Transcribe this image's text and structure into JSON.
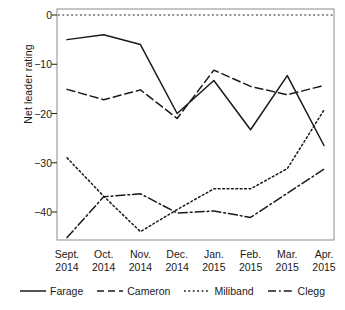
{
  "chart_data": {
    "type": "line",
    "title": "",
    "xlabel": "",
    "ylabel": "Net leader rating",
    "ylim": [
      -47,
      1
    ],
    "yticks": [
      0,
      -10,
      -20,
      -30,
      -40
    ],
    "ytick_labels": [
      "0",
      "−10",
      "−20",
      "−30",
      "−40"
    ],
    "grid": false,
    "zero_line": true,
    "legend_position": "bottom",
    "categories": [
      "Sept. 2014",
      "Oct. 2014",
      "Nov. 2014",
      "Dec. 2014",
      "Jan. 2015",
      "Feb. 2015",
      "Mar. 2015",
      "Apr. 2015"
    ],
    "category_lines": [
      [
        "Sept.",
        "2014"
      ],
      [
        "Oct.",
        "2014"
      ],
      [
        "Nov.",
        "2014"
      ],
      [
        "Dec.",
        "2014"
      ],
      [
        "Jan.",
        "2015"
      ],
      [
        "Feb.",
        "2015"
      ],
      [
        "Mar.",
        "2015"
      ],
      [
        "Apr.",
        "2015"
      ]
    ],
    "series": [
      {
        "name": "Farage",
        "style": "solid",
        "dash": "none",
        "color": "#1a1a1a",
        "values": [
          -5,
          -4,
          -6,
          -20,
          -13.3,
          -23.3,
          -12.3,
          -26.5
        ]
      },
      {
        "name": "Cameron",
        "style": "dashed",
        "dash": "8,4",
        "color": "#1a1a1a",
        "values": [
          -15.1,
          -17.2,
          -15.2,
          -21,
          -11.2,
          -14.5,
          -16.2,
          -14.3
        ]
      },
      {
        "name": "Miliband",
        "style": "dotted",
        "dash": "1.8,2.6",
        "color": "#1a1a1a",
        "values": [
          -29,
          -36.8,
          -44,
          -39.5,
          -35.3,
          -35.3,
          -31.2,
          -19.3
        ]
      },
      {
        "name": "Clegg",
        "style": "dash-dot",
        "dash": "9,3,1.8,3",
        "color": "#1a1a1a",
        "values": [
          -45.2,
          -36.9,
          -36.3,
          -40.2,
          -39.8,
          -41.1,
          -36.2,
          -31.3
        ]
      }
    ]
  },
  "legend": {
    "items": [
      {
        "label": "Farage",
        "style": "solid"
      },
      {
        "label": "Cameron",
        "style": "dashed"
      },
      {
        "label": "Miliband",
        "style": "dotted"
      },
      {
        "label": "Clegg",
        "style": "dash-dot"
      }
    ]
  },
  "axis": {
    "frame_color": "#8c8c8c",
    "line_color": "#1a1a1a"
  }
}
